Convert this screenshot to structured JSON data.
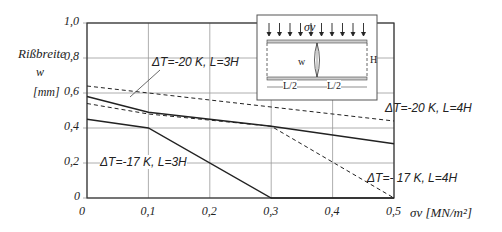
{
  "chart_data": {
    "type": "line",
    "title": "",
    "ylabel": "Rißbreite w [mm]",
    "ylabel_lines": [
      "Rißbreite",
      "w",
      "[mm]"
    ],
    "xlabel": "σv [MN/m²]",
    "xlim": [
      0,
      0.5
    ],
    "ylim": [
      0,
      1.0
    ],
    "x_ticks": [
      "0",
      "0,1",
      "0,2",
      "0,3",
      "0,4",
      "0,5"
    ],
    "y_ticks": [
      "0",
      "0,2",
      "0,4",
      "0,6",
      "0,8",
      "1,0"
    ],
    "grid": true,
    "series": [
      {
        "name": "ΔT=-20 K, L=3H",
        "style": "solid",
        "x": [
          0,
          0.1,
          0.3,
          0.5
        ],
        "values": [
          0.58,
          0.49,
          0.41,
          0.31
        ]
      },
      {
        "name": "ΔT=-20 K, L=4H",
        "style": "dashed",
        "x": [
          0,
          0.5
        ],
        "values": [
          0.64,
          0.44
        ]
      },
      {
        "name": "ΔT=- 17 K, L=4H",
        "style": "dashed",
        "x": [
          0,
          0.1,
          0.3,
          0.5
        ],
        "values": [
          0.54,
          0.48,
          0.41,
          0.0
        ]
      },
      {
        "name": "ΔT=-17 K, L=3H",
        "style": "solid",
        "x": [
          0,
          0.1,
          0.3,
          0.5
        ],
        "values": [
          0.45,
          0.4,
          0.0,
          0.0
        ]
      }
    ],
    "annotations": [
      "ΔT=-20 K, L=3H",
      "ΔT=-20 K, L=4H",
      "ΔT=- 17 K, L=4H",
      "ΔT=-17 K, L=3H"
    ],
    "inset": {
      "load_label": "σv",
      "width_label": "w",
      "height_label": "H",
      "half_length_left": "L/2",
      "half_length_right": "L/2"
    }
  }
}
